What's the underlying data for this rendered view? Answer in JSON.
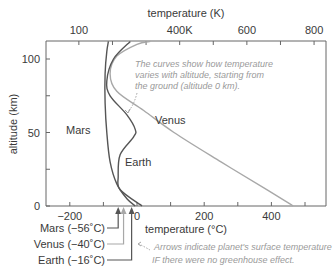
{
  "chart_data": {
    "type": "line",
    "title": "",
    "xlabel": "temperature (°C)",
    "x2label": "temperature (K)",
    "ylabel": "altitude (km)",
    "xlim": [
      -270,
      560
    ],
    "ylim": [
      0,
      112
    ],
    "x_ticks": [
      -200,
      0,
      200,
      400
    ],
    "x_tick_labels": [
      "−200",
      "0",
      "200",
      "400"
    ],
    "x2_ticks": [
      100,
      400,
      600,
      800
    ],
    "x2_tick_labels": [
      "100",
      "400K",
      "600",
      "800"
    ],
    "y_ticks": [
      0,
      50,
      100
    ],
    "y_tick_labels": [
      "0",
      "50",
      "100"
    ],
    "grid": false,
    "series": [
      {
        "name": "Mars",
        "color": "#555555",
        "points": [
          [
            -5,
            0
          ],
          [
            -30,
            5
          ],
          [
            -60,
            15
          ],
          [
            -80,
            30
          ],
          [
            -90,
            50
          ],
          [
            -95,
            70
          ],
          [
            -95,
            90
          ],
          [
            -90,
            105
          ],
          [
            -85,
            112
          ]
        ]
      },
      {
        "name": "Venus",
        "color": "#a8a8a8",
        "points": [
          [
            465,
            0
          ],
          [
            380,
            12
          ],
          [
            250,
            30
          ],
          [
            110,
            50
          ],
          [
            20,
            65
          ],
          [
            -60,
            78
          ],
          [
            -80,
            90
          ],
          [
            -60,
            102
          ],
          [
            0,
            110
          ],
          [
            40,
            112
          ]
        ]
      },
      {
        "name": "Earth",
        "color": "#555555",
        "points": [
          [
            15,
            0
          ],
          [
            -50,
            11
          ],
          [
            -56,
            20
          ],
          [
            -50,
            35
          ],
          [
            -10,
            47
          ],
          [
            -5,
            52
          ],
          [
            -30,
            62
          ],
          [
            -80,
            75
          ],
          [
            -90,
            85
          ],
          [
            -70,
            100
          ],
          [
            -20,
            112
          ]
        ]
      }
    ],
    "markers": [
      {
        "name": "Mars",
        "label": "Mars (−56˚C)",
        "value_c": -56
      },
      {
        "name": "Venus",
        "label": "Venus (−40˚C)",
        "value_c": -40
      },
      {
        "name": "Earth",
        "label": "Earth (−16˚C)",
        "value_c": -16
      }
    ],
    "annotations": {
      "curves_note": [
        "The curves show how temperature",
        "varies with altitude, starting from",
        "the ground (altitude 0 km)."
      ],
      "arrows_note": [
        "Arrows indicate planet's surface temperature",
        "IF there were no greenhouse effect."
      ]
    },
    "series_labels": {
      "mars": "Mars",
      "venus": "Venus",
      "earth": "Earth"
    }
  }
}
